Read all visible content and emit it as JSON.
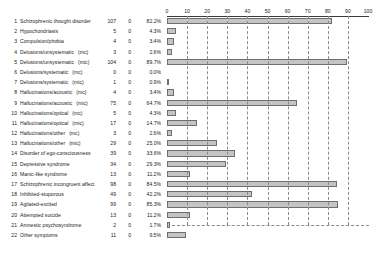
{
  "chart_data": {
    "type": "bar",
    "title": "",
    "xlabel": "",
    "ylabel": "",
    "orientation": "horizontal",
    "xlim": [
      0,
      100
    ],
    "grid": true,
    "grid_style": "dashed",
    "legend": "none",
    "axis_position": "top",
    "tick_labels": [
      "0",
      "10",
      "20",
      "30",
      "40",
      "50",
      "60",
      "70",
      "80",
      "90",
      "100"
    ],
    "tick_values": [
      0,
      10,
      20,
      30,
      40,
      50,
      60,
      70,
      80,
      90,
      100
    ],
    "columns": [
      "#",
      "Symptom",
      "n",
      "missing",
      "percent"
    ],
    "categories": [
      "Schizophrenic thought disorder",
      "Hypochondriasis",
      "Compulsion/phobia",
      "Delusions/unsystematic  (mc)",
      "Delusions/unsystematic  (mic)",
      "Delusions/systematic  (mc)",
      "Delusions/systematic  (mic)",
      "Hallucinations/acoustic  (mc)",
      "Hallucinations/acoustic  (mic)",
      "Hallucinations/optical  (mc)",
      "Hallucinations/optical  (mic)",
      "Hallucinations/other  (mc)",
      "Hallucinations/other  (mic)",
      "Disorder of ego-consciousness",
      "Depressive syndrome",
      "Manic-like syndrome",
      "Schizophrenic incongruent affect",
      "Inhibited-stuporous",
      "Agitated-excited",
      "Attempted suicide",
      "Amnestic psychosyndrome",
      "Other symptoms"
    ],
    "values": [
      82.2,
      4.3,
      3.4,
      2.6,
      89.7,
      0.0,
      0.9,
      3.4,
      64.7,
      4.3,
      14.7,
      2.6,
      25.0,
      33.6,
      29.3,
      11.2,
      84.5,
      42.2,
      85.3,
      11.2,
      1.7,
      9.5
    ],
    "counts": [
      107,
      5,
      4,
      3,
      104,
      0,
      1,
      4,
      75,
      5,
      17,
      3,
      29,
      39,
      34,
      13,
      98,
      49,
      99,
      13,
      2,
      11
    ],
    "missing": [
      0,
      0,
      0,
      0,
      0,
      0,
      0,
      0,
      0,
      0,
      0,
      0,
      0,
      0,
      0,
      0,
      0,
      0,
      0,
      0,
      0,
      0
    ]
  },
  "rows": [
    {
      "idx": "1",
      "label": "Schizophrenic thought disorder",
      "suffix": "",
      "n": "107",
      "missing": "0",
      "pct": "82.2%",
      "value": 82.2
    },
    {
      "idx": "2",
      "label": "Hypochondriasis",
      "suffix": "",
      "n": "5",
      "missing": "0",
      "pct": "4.3%",
      "value": 4.3
    },
    {
      "idx": "3",
      "label": "Compulsion/phobia",
      "suffix": "",
      "n": "4",
      "missing": "0",
      "pct": "3.4%",
      "value": 3.4
    },
    {
      "idx": "4",
      "label": "Delusions/unsystematic",
      "suffix": "(mc)",
      "n": "3",
      "missing": "0",
      "pct": "2.6%",
      "value": 2.6
    },
    {
      "idx": "5",
      "label": "Delusions/unsystematic",
      "suffix": "(mic)",
      "n": "104",
      "missing": "0",
      "pct": "89.7%",
      "value": 89.7
    },
    {
      "idx": "6",
      "label": "Delusions/systematic",
      "suffix": "(mc)",
      "n": "0",
      "missing": "0",
      "pct": "0.0%",
      "value": 0.0
    },
    {
      "idx": "7",
      "label": "Delusions/systematic",
      "suffix": "(mic)",
      "n": "1",
      "missing": "0",
      "pct": "0.9%",
      "value": 0.9
    },
    {
      "idx": "8",
      "label": "Hallucinations/acoustic",
      "suffix": "(mc)",
      "n": "4",
      "missing": "0",
      "pct": "3.4%",
      "value": 3.4
    },
    {
      "idx": "9",
      "label": "Hallucinations/acoustic",
      "suffix": "(mic)",
      "n": "75",
      "missing": "0",
      "pct": "64.7%",
      "value": 64.7
    },
    {
      "idx": "10",
      "label": "Hallucinations/optical",
      "suffix": "(mc)",
      "n": "5",
      "missing": "0",
      "pct": "4.3%",
      "value": 4.3
    },
    {
      "idx": "11",
      "label": "Hallucinations/optical",
      "suffix": "(mic)",
      "n": "17",
      "missing": "0",
      "pct": "14.7%",
      "value": 14.7
    },
    {
      "idx": "12",
      "label": "Hallucinations/other",
      "suffix": "(mc)",
      "n": "3",
      "missing": "0",
      "pct": "2.6%",
      "value": 2.6
    },
    {
      "idx": "13",
      "label": "Hallucinations/other",
      "suffix": "(mic)",
      "n": "29",
      "missing": "0",
      "pct": "25.0%",
      "value": 25.0
    },
    {
      "idx": "14",
      "label": "Disorder of ego-consciousness",
      "suffix": "",
      "n": "39",
      "missing": "0",
      "pct": "33.6%",
      "value": 33.6
    },
    {
      "idx": "15",
      "label": "Depressive syndrome",
      "suffix": "",
      "n": "34",
      "missing": "0",
      "pct": "29.3%",
      "value": 29.3
    },
    {
      "idx": "16",
      "label": "Manic-like syndrome",
      "suffix": "",
      "n": "13",
      "missing": "0",
      "pct": "11.2%",
      "value": 11.2
    },
    {
      "idx": "17",
      "label": "Schizophrenic incongruent affect",
      "suffix": "",
      "n": "98",
      "missing": "0",
      "pct": "84.5%",
      "value": 84.5
    },
    {
      "idx": "18",
      "label": "Inhibited-stuporous",
      "suffix": "",
      "n": "49",
      "missing": "0",
      "pct": "42.2%",
      "value": 42.2
    },
    {
      "idx": "19",
      "label": "Agitated-excited",
      "suffix": "",
      "n": "99",
      "missing": "0",
      "pct": "85.3%",
      "value": 85.3
    },
    {
      "idx": "20",
      "label": "Attempted suicide",
      "suffix": "",
      "n": "13",
      "missing": "0",
      "pct": "11.2%",
      "value": 11.2
    },
    {
      "idx": "21",
      "label": "Amnestic psychosyndrome",
      "suffix": "",
      "n": "2",
      "missing": "0",
      "pct": "1.7%",
      "value": 1.7
    },
    {
      "idx": "22",
      "label": "Other symptoms",
      "suffix": "",
      "n": "11",
      "missing": "0",
      "pct": "9.5%",
      "value": 9.5
    }
  ],
  "style": {
    "bar_fill": "#c4c4c4",
    "bar_border": "#6e6e6e",
    "grid_color": "#8a8a8a",
    "axis_color": "#3a3a3a",
    "text_color": "#1a1a1a",
    "background": "#ffffff"
  }
}
